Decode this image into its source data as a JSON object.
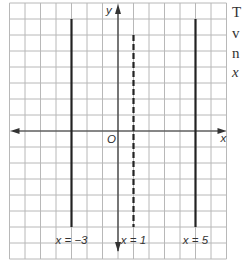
{
  "diagram": {
    "type": "coordinate-plane",
    "grid": {
      "columns": 14,
      "rows": 16,
      "cell_w": 15.5,
      "cell_h": 16,
      "left": 9.5,
      "top": 3,
      "color": "#b8b8b8"
    },
    "axes": {
      "x_label": "x",
      "y_label": "y",
      "origin_label": "O",
      "origin_px": {
        "x": 118,
        "y": 131
      },
      "color": "#333333"
    },
    "lines": [
      {
        "equation_label": "x = −3",
        "x_value": -3,
        "style": "solid",
        "px_x": 71.5,
        "y_top": 19,
        "y_bottom": 227
      },
      {
        "equation_label": "x = 1",
        "x_value": 1,
        "style": "dashed",
        "px_x": 133.5,
        "y_top": 35,
        "y_bottom": 227
      },
      {
        "equation_label": "x = 5",
        "x_value": 5,
        "style": "solid",
        "px_x": 195.5,
        "y_top": 19,
        "y_bottom": 227
      }
    ]
  },
  "side_text": {
    "line1": "T",
    "line2": "v",
    "line3": "n",
    "line4": "x"
  }
}
